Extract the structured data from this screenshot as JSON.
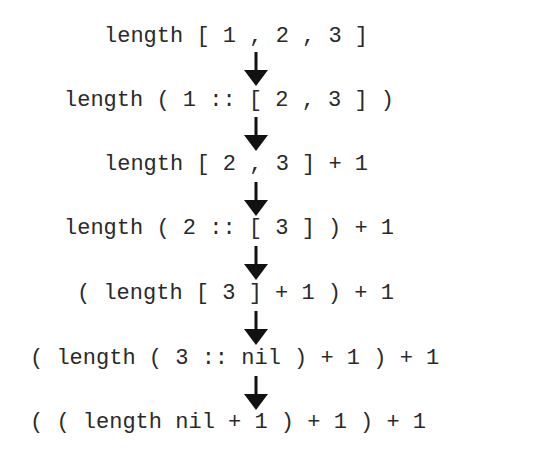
{
  "diagram": {
    "type": "evaluation-trace",
    "steps": [
      {
        "expression": "length [ 1 , 2 , 3 ]"
      },
      {
        "expression": "length ( 1 :: [ 2 , 3 ] )"
      },
      {
        "expression": "length [ 2 , 3 ] + 1"
      },
      {
        "expression": "length ( 2 :: [ 3 ] ) + 1"
      },
      {
        "expression": "( length [ 3 ] + 1 ) + 1"
      },
      {
        "expression": "( length ( 3 :: nil ) + 1 ) + 1"
      },
      {
        "expression": "( ( length nil + 1 ) + 1 ) + 1"
      }
    ],
    "arrows": [
      {
        "icon": "down-arrow-icon"
      },
      {
        "icon": "down-arrow-icon"
      },
      {
        "icon": "down-arrow-icon"
      },
      {
        "icon": "down-arrow-icon"
      },
      {
        "icon": "down-arrow-icon"
      },
      {
        "icon": "down-arrow-icon"
      }
    ],
    "colors": {
      "text": "#2a2a2a",
      "arrow": "#111111",
      "background": "#ffffff"
    }
  }
}
